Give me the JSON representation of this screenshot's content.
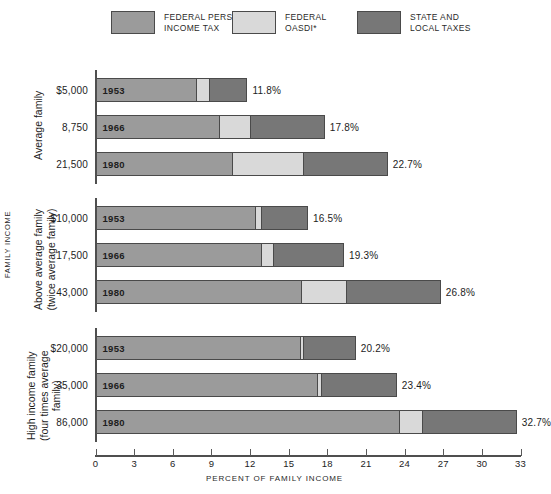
{
  "legend": {
    "items": [
      {
        "label": "FEDERAL PERSONAL\nINCOME TAX",
        "color": "#9b9b9b",
        "key": "federal-income-tax"
      },
      {
        "label": "FEDERAL\nOASDI*",
        "color": "#d9d9d9",
        "key": "federal-oasdi"
      },
      {
        "label": "STATE AND\nLOCAL TAXES",
        "color": "#777777",
        "key": "state-local-taxes"
      }
    ]
  },
  "axis": {
    "y_title": "FAMILY INCOME",
    "x_title": "PERCENT OF FAMILY INCOME",
    "x_ticks": [
      0,
      3,
      6,
      9,
      12,
      15,
      18,
      21,
      24,
      27,
      30,
      33
    ],
    "xlim": [
      0,
      33
    ]
  },
  "chart_data": {
    "type": "bar",
    "orientation": "horizontal",
    "stacked": true,
    "title": "",
    "xlabel": "PERCENT OF FAMILY INCOME",
    "ylabel": "FAMILY INCOME",
    "xlim": [
      0,
      33
    ],
    "xticks": [
      0,
      3,
      6,
      9,
      12,
      15,
      18,
      21,
      24,
      27,
      30,
      33
    ],
    "grid": false,
    "legend_position": "top",
    "series": [
      {
        "name": "FEDERAL PERSONAL INCOME TAX",
        "color": "#9b9b9b"
      },
      {
        "name": "FEDERAL OASDI*",
        "color": "#d9d9d9"
      },
      {
        "name": "STATE AND LOCAL TAXES",
        "color": "#777777"
      }
    ],
    "groups": [
      {
        "label": "Average family",
        "rows": [
          {
            "income": "$5,000",
            "year": "1953",
            "federal_income_tax": 7.8,
            "federal_oasdi": 1.1,
            "state_local": 2.9,
            "total": 11.8,
            "total_label": "11.8%"
          },
          {
            "income": "8,750",
            "year": "1966",
            "federal_income_tax": 9.6,
            "federal_oasdi": 2.5,
            "state_local": 5.7,
            "total": 17.8,
            "total_label": "17.8%"
          },
          {
            "income": "21,500",
            "year": "1980",
            "federal_income_tax": 10.6,
            "federal_oasdi": 5.6,
            "state_local": 6.5,
            "total": 22.7,
            "total_label": "22.7%"
          }
        ]
      },
      {
        "label": "Above average family\n(twice average family)",
        "rows": [
          {
            "income": "$10,000",
            "year": "1953",
            "federal_income_tax": 12.4,
            "federal_oasdi": 0.6,
            "state_local": 3.5,
            "total": 16.5,
            "total_label": "16.5%"
          },
          {
            "income": "17,500",
            "year": "1966",
            "federal_income_tax": 12.9,
            "federal_oasdi": 1.0,
            "state_local": 5.4,
            "total": 19.3,
            "total_label": "19.3%"
          },
          {
            "income": "43,000",
            "year": "1980",
            "federal_income_tax": 16.0,
            "federal_oasdi": 3.6,
            "state_local": 7.2,
            "total": 26.8,
            "total_label": "26.8%"
          }
        ]
      },
      {
        "label": "High income family\n(four times average family)",
        "rows": [
          {
            "income": "$20,000",
            "year": "1953",
            "federal_income_tax": 15.9,
            "federal_oasdi": 0.3,
            "state_local": 4.0,
            "total": 20.2,
            "total_label": "20.2%"
          },
          {
            "income": "35,000",
            "year": "1966",
            "federal_income_tax": 17.2,
            "federal_oasdi": 0.4,
            "state_local": 5.8,
            "total": 23.4,
            "total_label": "23.4%"
          },
          {
            "income": "86,000",
            "year": "1980",
            "federal_income_tax": 23.6,
            "federal_oasdi": 1.9,
            "state_local": 7.2,
            "total": 32.7,
            "total_label": "32.7%"
          }
        ]
      }
    ]
  }
}
